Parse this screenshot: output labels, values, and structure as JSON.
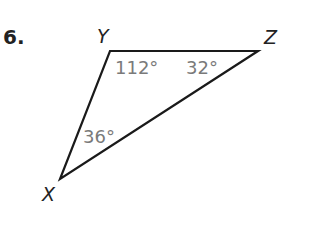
{
  "problem": {
    "number": "6."
  },
  "triangle": {
    "vertices": [
      {
        "name": "Y",
        "x": 110,
        "y": 51
      },
      {
        "name": "Z",
        "x": 258,
        "y": 51
      },
      {
        "name": "X",
        "x": 60,
        "y": 179
      }
    ],
    "angles": [
      {
        "vertex": "Y",
        "label": "112°"
      },
      {
        "vertex": "Z",
        "label": "32°"
      },
      {
        "vertex": "X",
        "label": "36°"
      }
    ],
    "stroke_color": "#1a1a1a",
    "angle_text_color": "#7a7a7a"
  }
}
